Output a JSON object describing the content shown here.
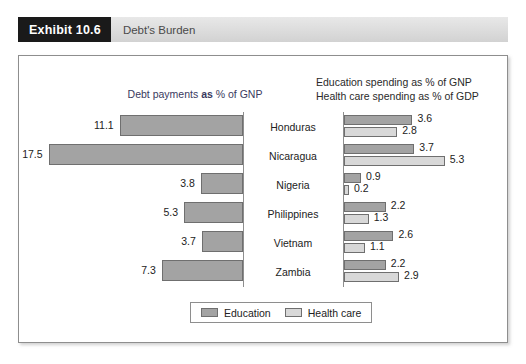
{
  "exhibit": {
    "tag": "Exhibit 10.6",
    "title": "Debt's Burden"
  },
  "headings": {
    "left_prefix": "Debt payments ",
    "left_bold": "as",
    "left_suffix": " % of GNP",
    "right_line1": "Education spending as % of GNP",
    "right_line2": "Health care spending as % of GDP"
  },
  "legend": {
    "education_label": "Education",
    "health_label": "Health care",
    "education_color": "#a3a3a3",
    "health_color": "#d8d8d8"
  },
  "chart_data": {
    "type": "bar",
    "title": "Debt's Burden",
    "orientation": "horizontal",
    "categories": [
      "Honduras",
      "Nicaragua",
      "Nigeria",
      "Philippines",
      "Vietnam",
      "Zambia"
    ],
    "xlabel": "",
    "ylabel": "",
    "panels": [
      {
        "name": "Debt payments as % of GNP",
        "direction": "right-to-left",
        "series": [
          {
            "name": "Debt payments",
            "unit": "% of GNP",
            "values": [
              11.1,
              17.5,
              3.8,
              5.3,
              3.7,
              7.3
            ],
            "labels": [
              "11.1",
              "17.5",
              "3.8",
              "5.3",
              "3.7",
              "7.3"
            ],
            "color": "#a3a3a3"
          }
        ],
        "xlim": [
          0,
          18
        ]
      },
      {
        "name": "Education and Health care spending",
        "direction": "left-to-right",
        "series": [
          {
            "name": "Education",
            "unit": "% of GNP",
            "values": [
              3.6,
              3.7,
              0.9,
              2.2,
              2.6,
              2.2
            ],
            "labels": [
              "3.6",
              "3.7",
              "0.9",
              "2.2",
              "2.6",
              "2.2"
            ],
            "color": "#a3a3a3"
          },
          {
            "name": "Health care",
            "unit": "% of GDP",
            "values": [
              2.8,
              5.3,
              0.2,
              1.3,
              1.1,
              2.9
            ],
            "labels": [
              "2.8",
              "5.3",
              "0.2",
              "1.3",
              "1.1",
              "2.9"
            ],
            "color": "#d8d8d8"
          }
        ],
        "xlim": [
          0,
          6
        ]
      }
    ],
    "grid": false,
    "legend_position": "bottom-center"
  }
}
